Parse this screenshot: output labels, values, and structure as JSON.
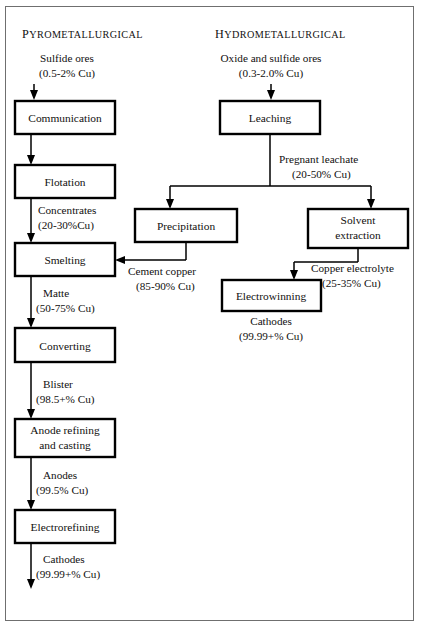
{
  "figure": {
    "type": "process-flow-diagram",
    "columns": [
      {
        "id": "pyro",
        "heading_first": "P",
        "heading_rest": "YROMETALLURGICAL"
      },
      {
        "id": "hydro",
        "heading_first": "H",
        "heading_rest": "YDROMETALLURGICAL"
      }
    ]
  },
  "feeds": {
    "pyro": {
      "line1": "Sulfide ores",
      "line2": "(0.5-2% Cu)"
    },
    "hydro": {
      "line1": "Oxide and sulfide ores",
      "line2": "(0.3-2.0% Cu)"
    }
  },
  "nodes": {
    "communication": {
      "label": "Communication"
    },
    "flotation": {
      "label": "Flotation"
    },
    "smelting": {
      "label": "Smelting"
    },
    "converting": {
      "label": "Converting"
    },
    "anode_refining": {
      "label_line1": "Anode refining",
      "label_line2": "and casting"
    },
    "electrorefining": {
      "label": "Electrorefining"
    },
    "leaching": {
      "label": "Leaching"
    },
    "precipitation": {
      "label": "Precipitation"
    },
    "solvent_extraction": {
      "label_line1": "Solvent",
      "label_line2": "extraction"
    },
    "electrowinning": {
      "label": "Electrowinning"
    }
  },
  "streams": {
    "concentrates": {
      "line1": "Concentrates",
      "line2": "(20-30%Cu)"
    },
    "matte": {
      "line1": "Matte",
      "line2": "(50-75% Cu)"
    },
    "blister": {
      "line1": "Blister",
      "line2": "(98.5+% Cu)"
    },
    "anodes": {
      "line1": "Anodes",
      "line2": "(99.5% Cu)"
    },
    "cathodes_pyro": {
      "line1": "Cathodes",
      "line2": "(99.99+% Cu)"
    },
    "pregnant_leachate": {
      "line1": "Pregnant leachate",
      "line2": "(20-50% Cu)"
    },
    "cement_copper": {
      "line1": "Cement copper",
      "line2": "(85-90% Cu)"
    },
    "copper_electrolyte": {
      "line1": "Copper electrolyte",
      "line2": "(25-35% Cu)"
    },
    "cathodes_hydro": {
      "line1": "Cathodes",
      "line2": "(99.99+% Cu)"
    }
  },
  "colors": {
    "ink": "#11100f",
    "stroke": "#000000",
    "frame": "#6f6f6f",
    "paper": "#ffffff"
  }
}
